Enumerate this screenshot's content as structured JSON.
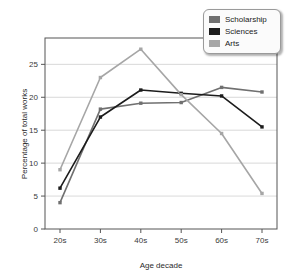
{
  "chart_data": {
    "type": "line",
    "title": "",
    "xlabel": "Age decade",
    "ylabel": "Percentage of total works",
    "categories": [
      "20s",
      "30s",
      "40s",
      "50s",
      "60s",
      "70s"
    ],
    "yticks": [
      0,
      5,
      10,
      15,
      20,
      25
    ],
    "ylim": [
      0,
      29
    ],
    "grid": "horizontal",
    "legend_position": "top-right",
    "series": [
      {
        "name": "Scholarship",
        "color": "#707070",
        "values": [
          4.0,
          18.2,
          19.1,
          19.2,
          21.5,
          20.8
        ]
      },
      {
        "name": "Sciences",
        "color": "#1c1c1c",
        "values": [
          6.2,
          17.0,
          21.1,
          20.6,
          20.2,
          15.5
        ]
      },
      {
        "name": "Arts",
        "color": "#a6a6a6",
        "values": [
          9.0,
          23.0,
          27.3,
          20.4,
          14.5,
          5.4
        ]
      }
    ]
  },
  "axes": {
    "x_tick_labels": [
      "20s",
      "30s",
      "40s",
      "50s",
      "60s",
      "70s"
    ],
    "y_tick_labels": [
      "0",
      "5",
      "10",
      "15",
      "20",
      "25"
    ],
    "x_axis_title": "Age decade",
    "y_axis_title": "Percentage of total works"
  },
  "legend": {
    "items": [
      {
        "label": "Scholarship",
        "color": "#707070"
      },
      {
        "label": "Sciences",
        "color": "#1c1c1c"
      },
      {
        "label": "Arts",
        "color": "#a6a6a6"
      }
    ]
  },
  "style": {
    "plot_border_color": "#555555",
    "grid_color": "#cfcfcf",
    "background": "#ffffff"
  }
}
